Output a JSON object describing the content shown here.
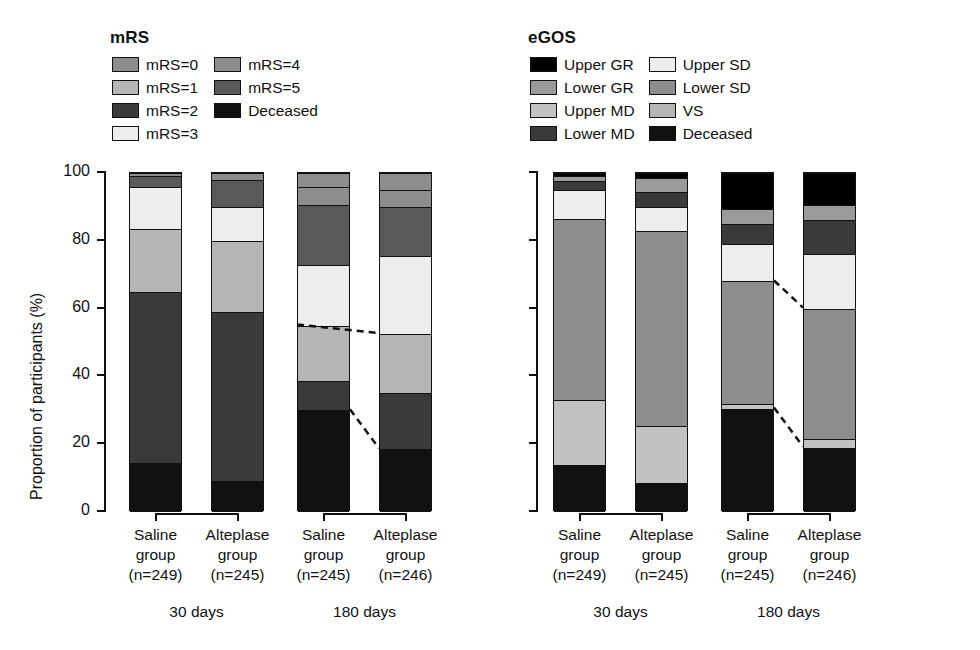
{
  "figure": {
    "ylabel": "Proportion of participants (%)",
    "yticks": [
      "0",
      "20",
      "40",
      "60",
      "80",
      "100"
    ],
    "ylim": [
      0,
      100
    ]
  },
  "panels": [
    {
      "id": "mrs",
      "legend_title": "mRS",
      "legend": [
        {
          "label": "mRS=0",
          "color": "#8d8d8d"
        },
        {
          "label": "mRS=1",
          "color": "#b5b5b5"
        },
        {
          "label": "mRS=2",
          "color": "#3a3a3a"
        },
        {
          "label": "mRS=3",
          "color": "#ededed"
        },
        {
          "label": "mRS=4",
          "color": "#8d8d8d"
        },
        {
          "label": "mRS=5",
          "color": "#595959"
        },
        {
          "label": "Deceased",
          "color": "#111111"
        }
      ]
    },
    {
      "id": "egos",
      "legend_title": "eGOS",
      "legend": [
        {
          "label": "Upper GR",
          "color": "#000000"
        },
        {
          "label": "Lower GR",
          "color": "#9a9a9a"
        },
        {
          "label": "Upper MD",
          "color": "#c2c2c2"
        },
        {
          "label": "Lower MD",
          "color": "#3a3a3a"
        },
        {
          "label": "Upper SD",
          "color": "#ededed"
        },
        {
          "label": "Lower SD",
          "color": "#8d8d8d"
        },
        {
          "label": "VS",
          "color": "#b5b5b5"
        },
        {
          "label": "Deceased",
          "color": "#111111"
        }
      ]
    }
  ],
  "categories": [
    {
      "name": "Saline",
      "line2": "group",
      "line3": "(n=249)"
    },
    {
      "name": "Alteplase",
      "line2": "group",
      "line3": "(n=245)"
    },
    {
      "name": "Saline",
      "line2": "group",
      "line3": "(n=245)"
    },
    {
      "name": "Alteplase",
      "line2": "group",
      "line3": "(n=246)"
    }
  ],
  "groups": [
    {
      "label": "30 days"
    },
    {
      "label": "180 days"
    }
  ],
  "chart_data": [
    {
      "type": "bar",
      "subtype": "stacked-100",
      "title": "mRS",
      "xlabel": "",
      "ylabel": "Proportion of participants (%)",
      "ylim": [
        0,
        100
      ],
      "grid": false,
      "legend_position": "top-left",
      "categories": [
        "Saline group (n=249) 30 days",
        "Alteplase group (n=245) 30 days",
        "Saline group (n=245) 180 days",
        "Alteplase group (n=246) 180 days"
      ],
      "series": [
        {
          "name": "Deceased",
          "color": "#111111",
          "values": [
            14.5,
            9.0,
            30.0,
            18.5
          ]
        },
        {
          "name": "mRS=2",
          "color": "#3a3a3a",
          "values": [
            50.5,
            50.0,
            8.5,
            16.5
          ]
        },
        {
          "name": "mRS=1",
          "color": "#b5b5b5",
          "values": [
            18.5,
            21.0,
            16.5,
            17.5
          ]
        },
        {
          "name": "mRS=3",
          "color": "#ededed",
          "values": [
            12.5,
            10.0,
            18.0,
            23.0
          ]
        },
        {
          "name": "mRS=5",
          "color": "#595959",
          "values": [
            3.0,
            8.0,
            17.5,
            14.5
          ]
        },
        {
          "name": "mRS=4",
          "color": "#8d8d8d",
          "values": [
            0.0,
            0.0,
            5.5,
            5.0
          ]
        },
        {
          "name": "mRS=0",
          "color": "#8d8d8d",
          "values": [
            1.0,
            2.0,
            4.0,
            5.0
          ]
        }
      ]
    },
    {
      "type": "bar",
      "subtype": "stacked-100",
      "title": "eGOS",
      "xlabel": "",
      "ylabel": "Proportion of participants (%)",
      "ylim": [
        0,
        100
      ],
      "grid": false,
      "legend_position": "top-left",
      "categories": [
        "Saline group (n=249) 30 days",
        "Alteplase group (n=245) 30 days",
        "Saline group (n=245) 180 days",
        "Alteplase group (n=246) 180 days"
      ],
      "series": [
        {
          "name": "Deceased",
          "color": "#111111",
          "values": [
            14.0,
            8.5,
            30.5,
            19.0
          ]
        },
        {
          "name": "Upper MD",
          "color": "#c2c2c2",
          "values": [
            19.0,
            17.0,
            1.5,
            2.5
          ]
        },
        {
          "name": "Lower SD",
          "color": "#8d8d8d",
          "values": [
            53.5,
            57.5,
            36.0,
            38.5
          ]
        },
        {
          "name": "Upper SD",
          "color": "#ededed",
          "values": [
            8.5,
            7.0,
            11.0,
            16.0
          ]
        },
        {
          "name": "Lower MD",
          "color": "#3a3a3a",
          "values": [
            2.5,
            4.5,
            6.0,
            10.0
          ]
        },
        {
          "name": "Lower GR",
          "color": "#9a9a9a",
          "values": [
            1.5,
            4.0,
            4.5,
            4.5
          ]
        },
        {
          "name": "Upper GR",
          "color": "#000000",
          "values": [
            1.0,
            1.5,
            10.5,
            9.5
          ]
        }
      ]
    }
  ]
}
